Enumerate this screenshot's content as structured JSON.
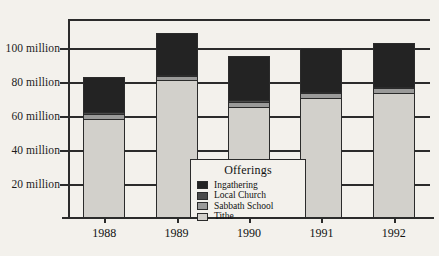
{
  "chart_data": {
    "type": "bar",
    "stacked": true,
    "title": "",
    "subtitle": "",
    "xlabel": "",
    "ylabel": "",
    "categories": [
      "1988",
      "1989",
      "1990",
      "1991",
      "1992"
    ],
    "ytick_labels": [
      "100 million",
      "80 million",
      "60 million",
      "40 million",
      "20 million"
    ],
    "ytick_values": [
      100,
      80,
      60,
      40,
      20
    ],
    "ylim": [
      0,
      117
    ],
    "grid": "horizontal",
    "legend_position": "inside-center-bottom",
    "legend_title": "Offerings",
    "series": [
      {
        "name": "Tithe",
        "color": "#d2d0cb",
        "values": [
          58,
          81,
          65,
          70,
          73
        ]
      },
      {
        "name": "Sabbath School",
        "color": "#9a9a99",
        "values": [
          3,
          2,
          3,
          3,
          3
        ]
      },
      {
        "name": "Local Church",
        "color": "#4a4a4a",
        "values": [
          1,
          1,
          1,
          1,
          1
        ]
      },
      {
        "name": "Ingathering",
        "color": "#232323",
        "values": [
          21,
          25,
          26,
          26,
          26
        ]
      }
    ],
    "totals": [
      83,
      109,
      95,
      100,
      103
    ],
    "units": "million"
  },
  "axis": {
    "y_labels": [
      {
        "text": "100 million",
        "value": 100
      },
      {
        "text": "80 million",
        "value": 80
      },
      {
        "text": "60 million",
        "value": 60
      },
      {
        "text": "40 million",
        "value": 40
      },
      {
        "text": "20 million",
        "value": 20
      }
    ],
    "x_labels": [
      "1988",
      "1989",
      "1990",
      "1991",
      "1992"
    ]
  },
  "legend": {
    "title": "Offerings",
    "items": [
      {
        "label": "Ingathering",
        "color": "#232323"
      },
      {
        "label": "Local Church",
        "color": "#4a4a4a"
      },
      {
        "label": "Sabbath School",
        "color": "#9a9a99"
      },
      {
        "label": "Tithe",
        "color": "#d2d0cb"
      }
    ]
  },
  "colors": {
    "axis": "#2b2b2b",
    "background": "#f3f1ec",
    "ingathering": "#232323",
    "local_church": "#4a4a4a",
    "sabbath_school": "#9a9a99",
    "tithe": "#d2d0cb"
  }
}
